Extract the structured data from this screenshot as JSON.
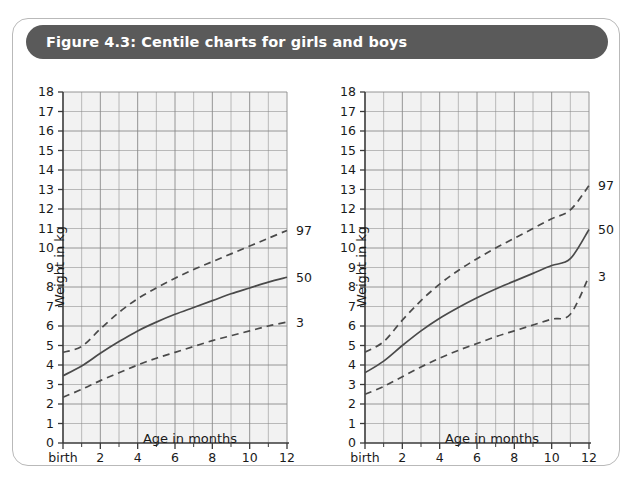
{
  "figure": {
    "title": "Figure 4.3: Centile charts for girls and boys",
    "title_bar_color": "#5a5a5a",
    "card_border_color": "#b9b9b9",
    "card_background": "#ffffff"
  },
  "chart_data": [
    {
      "id": "girls",
      "type": "line",
      "title": "",
      "xlabel": "Age in months",
      "ylabel": "Weight in kg",
      "xlim": [
        0,
        12
      ],
      "ylim": [
        0,
        18
      ],
      "grid": true,
      "legend_position": "right-edge-labels",
      "x_tick_labels": [
        "birth",
        "2",
        "4",
        "6",
        "8",
        "10",
        "12"
      ],
      "x_tick_values": [
        0,
        2,
        4,
        6,
        8,
        10,
        12
      ],
      "x_minor_ticks": [
        1,
        3,
        5,
        7,
        9,
        11
      ],
      "y_tick_labels": [
        "0",
        "1",
        "2",
        "3",
        "4",
        "5",
        "6",
        "7",
        "8",
        "9",
        "10",
        "11",
        "12",
        "13",
        "14",
        "15",
        "16",
        "17",
        "18"
      ],
      "y_tick_values": [
        0,
        1,
        2,
        3,
        4,
        5,
        6,
        7,
        8,
        9,
        10,
        11,
        12,
        13,
        14,
        15,
        16,
        17,
        18
      ],
      "x": [
        0,
        1,
        2,
        3,
        4,
        5,
        6,
        7,
        8,
        9,
        10,
        11,
        12
      ],
      "series": [
        {
          "name": "97",
          "label": "97",
          "style": "dashed",
          "color": "#4a4a4a",
          "values": [
            4.65,
            4.95,
            5.85,
            6.7,
            7.4,
            7.95,
            8.45,
            8.9,
            9.3,
            9.7,
            10.1,
            10.5,
            10.9
          ]
        },
        {
          "name": "50",
          "label": "50",
          "style": "solid",
          "color": "#4a4a4a",
          "values": [
            3.45,
            3.95,
            4.6,
            5.2,
            5.75,
            6.2,
            6.6,
            6.95,
            7.3,
            7.65,
            7.95,
            8.25,
            8.5
          ]
        },
        {
          "name": "3",
          "label": "3",
          "style": "dashed",
          "color": "#4a4a4a",
          "values": [
            2.35,
            2.75,
            3.2,
            3.6,
            4.0,
            4.35,
            4.65,
            4.95,
            5.25,
            5.5,
            5.75,
            6.0,
            6.2
          ]
        }
      ]
    },
    {
      "id": "boys",
      "type": "line",
      "title": "",
      "xlabel": "Age in months",
      "ylabel": "Weight in kg",
      "xlim": [
        0,
        12
      ],
      "ylim": [
        0,
        18
      ],
      "grid": true,
      "legend_position": "right-edge-labels",
      "x_tick_labels": [
        "birth",
        "2",
        "4",
        "6",
        "8",
        "10",
        "12"
      ],
      "x_tick_values": [
        0,
        2,
        4,
        6,
        8,
        10,
        12
      ],
      "x_minor_ticks": [
        1,
        3,
        5,
        7,
        9,
        11
      ],
      "y_tick_labels": [
        "0",
        "1",
        "2",
        "3",
        "4",
        "5",
        "6",
        "7",
        "8",
        "9",
        "10",
        "11",
        "12",
        "13",
        "14",
        "15",
        "16",
        "17",
        "18"
      ],
      "y_tick_values": [
        0,
        1,
        2,
        3,
        4,
        5,
        6,
        7,
        8,
        9,
        10,
        11,
        12,
        13,
        14,
        15,
        16,
        17,
        18
      ],
      "x": [
        0,
        1,
        2,
        3,
        4,
        5,
        6,
        7,
        8,
        9,
        10,
        11,
        12
      ],
      "series": [
        {
          "name": "97",
          "label": "97",
          "style": "dashed",
          "color": "#4a4a4a",
          "values": [
            4.65,
            5.2,
            6.3,
            7.3,
            8.15,
            8.85,
            9.45,
            10.0,
            10.5,
            11.0,
            11.5,
            11.95,
            13.2
          ]
        },
        {
          "name": "50",
          "label": "50",
          "style": "solid",
          "color": "#4a4a4a",
          "values": [
            3.6,
            4.2,
            5.0,
            5.75,
            6.4,
            6.95,
            7.45,
            7.9,
            8.3,
            8.7,
            9.1,
            9.45,
            10.95
          ]
        },
        {
          "name": "3",
          "label": "3",
          "style": "dashed",
          "color": "#4a4a4a",
          "values": [
            2.5,
            2.9,
            3.4,
            3.9,
            4.35,
            4.75,
            5.1,
            5.45,
            5.75,
            6.05,
            6.35,
            6.6,
            8.55
          ]
        }
      ]
    }
  ],
  "style": {
    "plot_background": "#f2f2f2",
    "gridline_color": "#8a8a8a",
    "axis_color": "#3a3a3a",
    "curve_color": "#4a4a4a",
    "text_color": "#1a1a1a"
  }
}
